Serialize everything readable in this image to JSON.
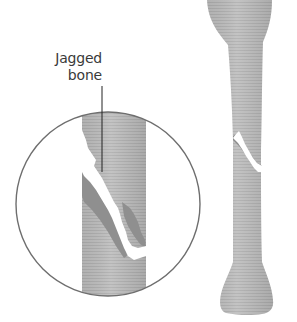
{
  "diagram": {
    "callout": {
      "line1": "Jagged",
      "line2": "bone"
    },
    "colors": {
      "bone_fill": "#b9b9b9",
      "bone_shade": "#8a8a8a",
      "fracture_gap": "#ffffff",
      "circle_stroke": "#6e6e6e",
      "leader_line": "#222222",
      "text": "#3a3a3a"
    }
  }
}
